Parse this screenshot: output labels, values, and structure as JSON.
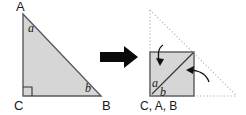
{
  "figure": {
    "colors": {
      "shape_fill": "#d6d6d6",
      "shape_stroke": "#5a5a5a",
      "dotted_stroke": "#b0b0b0",
      "arrow_black": "#0a0a0a",
      "text": "#1a1a1a",
      "background": "#ffffff"
    }
  },
  "left_diagram": {
    "name": "original-right-triangle",
    "vertices": {
      "A": {
        "label": "A",
        "x": 23,
        "y": 14
      },
      "B": {
        "label": "B",
        "x": 101,
        "y": 96
      },
      "C": {
        "label": "C",
        "x": 23,
        "y": 96
      }
    },
    "angles": {
      "a": {
        "label": "a",
        "at_vertex": "A"
      },
      "b": {
        "label": "b",
        "at_vertex": "B"
      },
      "right_angle": {
        "label": "",
        "at_vertex": "C"
      }
    }
  },
  "transform_arrow": {
    "name": "transformation-arrow",
    "label": ""
  },
  "right_diagram": {
    "name": "folded-square",
    "square": {
      "x": 150,
      "y": 52,
      "size": 44
    },
    "dotted_triangle_apex": {
      "x": 150,
      "y": 10
    },
    "dotted_triangle_right": {
      "x": 237,
      "y": 96
    },
    "vertex_label": "C, A, B",
    "angles": {
      "a": {
        "label": "a"
      },
      "b": {
        "label": "b"
      }
    },
    "fold_arrows": [
      {
        "name": "fold-arrow-top",
        "label": ""
      },
      {
        "name": "fold-arrow-right",
        "label": ""
      }
    ]
  }
}
